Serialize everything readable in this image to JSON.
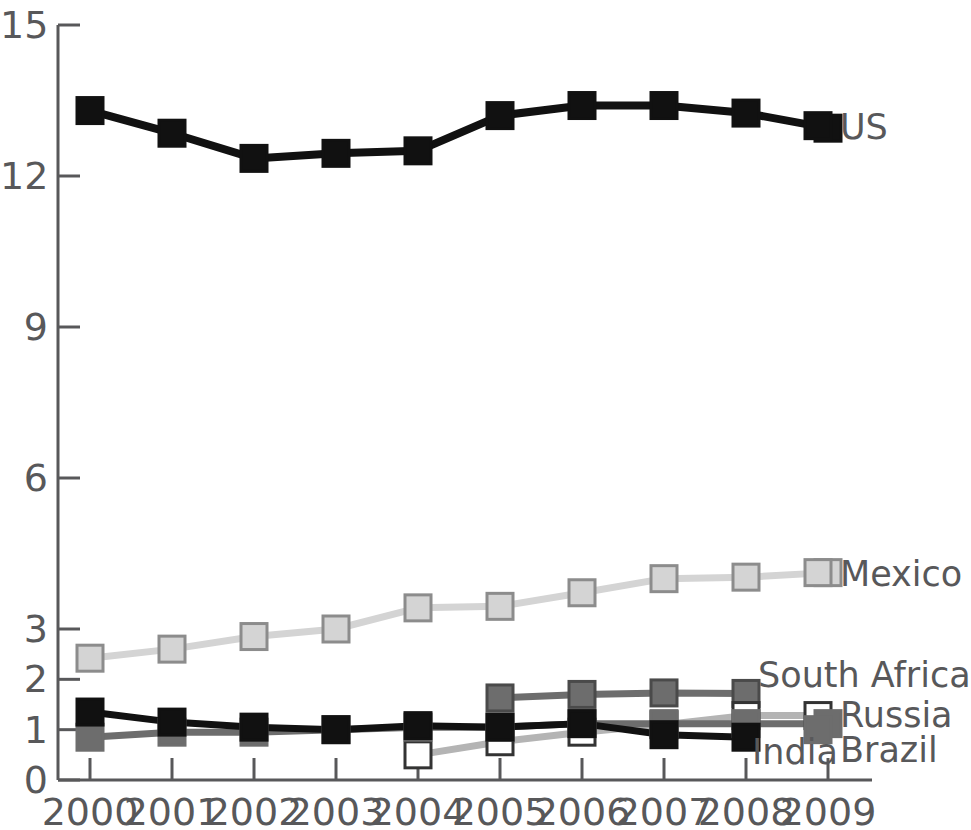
{
  "chart_data": {
    "type": "line",
    "title": "",
    "subtitle": "",
    "xlabel": "",
    "ylabel": "",
    "x": [
      2000,
      2001,
      2002,
      2003,
      2004,
      2005,
      2006,
      2007,
      2008,
      2009
    ],
    "categories": [
      "2000",
      "2001",
      "2002",
      "2003",
      "2004",
      "2005",
      "2006",
      "2007",
      "2008",
      "2009"
    ],
    "ytick_labels": [
      "0",
      "1",
      "2",
      "3",
      "6",
      "9",
      "12",
      "15"
    ],
    "ytick_values": [
      0,
      1,
      2,
      3,
      6,
      9,
      12,
      15
    ],
    "ylim": [
      0,
      15
    ],
    "xlim": [
      2000,
      2009
    ],
    "grid": false,
    "legend_position": "right-of-series-ends",
    "series": [
      {
        "name": "US",
        "values": [
          13.3,
          12.85,
          12.35,
          12.45,
          12.5,
          13.2,
          13.4,
          13.4,
          13.25,
          12.95
        ],
        "color": "#111111",
        "marker_fill": "#111111",
        "marker_edge": "#111111",
        "label_x": 2009,
        "label_y": 13.0
      },
      {
        "name": "Mexico",
        "values": [
          2.42,
          2.6,
          2.85,
          3.0,
          3.42,
          3.45,
          3.72,
          4.0,
          4.03,
          4.12
        ],
        "color": "#d4d4d4",
        "marker_fill": "#d4d4d4",
        "marker_edge": "#8c8c8c",
        "label_x": 2009,
        "label_y": 4.12
      },
      {
        "name": "South Africa",
        "values": [
          null,
          null,
          null,
          null,
          null,
          1.63,
          1.7,
          1.73,
          1.72,
          null
        ],
        "color": "#6d6d6d",
        "marker_fill": "#6d6d6d",
        "marker_edge": "#4a4a4a",
        "label_x": 2008,
        "label_y": 2.05
      },
      {
        "name": "Russia",
        "values": [
          null,
          null,
          null,
          null,
          0.5,
          0.76,
          0.95,
          1.1,
          1.28,
          null
        ],
        "color": "#b4b4b4",
        "marker_fill": "#ffffff",
        "marker_edge": "#333333",
        "label_x": 2009,
        "label_y": 1.28
      },
      {
        "name": "Brazil",
        "values": [
          0.85,
          0.95,
          0.95,
          1.0,
          1.05,
          1.05,
          1.12,
          1.12,
          1.12,
          1.12
        ],
        "color": "#6d6d6d",
        "marker_fill": "#6d6d6d",
        "marker_edge": "#6d6d6d",
        "label_x": 2009,
        "label_y": 1.0
      },
      {
        "name": "India",
        "values": [
          1.35,
          1.15,
          1.05,
          1.0,
          1.08,
          1.05,
          1.12,
          0.9,
          0.85,
          null
        ],
        "color": "#111111",
        "marker_fill": "#111111",
        "marker_edge": "#111111",
        "label_x": 2008,
        "label_y": 0.55
      }
    ],
    "series_labels": [
      {
        "text": "US"
      },
      {
        "text": "Mexico"
      },
      {
        "text": "South Africa"
      },
      {
        "text": "Russia"
      },
      {
        "text": "Brazil"
      },
      {
        "text": "India"
      }
    ],
    "colors": {
      "axis": "#58585a",
      "text": "#58585a",
      "us": "#111111",
      "mexico": "#d4d4d4",
      "south_africa": "#6d6d6d",
      "russia_fill": "#ffffff",
      "brazil": "#6d6d6d",
      "india": "#111111",
      "background": "#ffffff"
    }
  }
}
